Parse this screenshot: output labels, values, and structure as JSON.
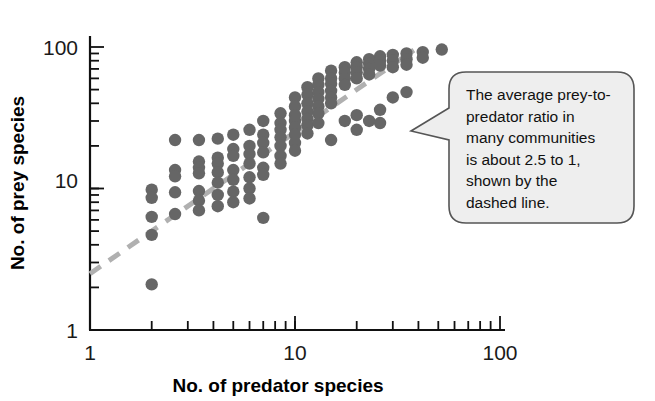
{
  "figure": {
    "background_color": "#ffffff",
    "point_color": "#666666",
    "trendline_color": "#b0b0b0",
    "axis_color": "#111111",
    "callout_fill": "#eeeeee",
    "callout_stroke": "#555555"
  },
  "axes": {
    "x_title": "No. of predator species",
    "y_title": "No. of prey species",
    "x_ticks": [
      "1",
      "10",
      "100"
    ],
    "y_ticks": [
      "1",
      "10",
      "100"
    ]
  },
  "callout": {
    "lines": [
      "The average prey-to-",
      "predator ratio in",
      "many communities",
      "is about 2.5 to 1,",
      "shown by the",
      "dashed line."
    ],
    "full_text": "The average prey-to-predator ratio in many communities is about 2.5 to 1, shown by the dashed line."
  },
  "chart_data": {
    "type": "scatter",
    "title": "",
    "xlabel": "No. of predator species",
    "ylabel": "No. of prey species",
    "xscale": "log",
    "yscale": "log",
    "xlim": [
      1,
      100
    ],
    "ylim": [
      1,
      100
    ],
    "xticks": [
      1,
      10,
      100
    ],
    "yticks": [
      1,
      10,
      100
    ],
    "grid": false,
    "legend": null,
    "annotations": [
      {
        "text": "The average prey-to-predator ratio in many communities is about 2.5 to 1, shown by the dashed line.",
        "type": "callout-balloon",
        "points_to": "dashed trend line"
      }
    ],
    "series": [
      {
        "name": "Food web communities",
        "marker": "circle",
        "color": "#666666",
        "points": [
          [
            2.0,
            9.8
          ],
          [
            2.0,
            8.6
          ],
          [
            2.0,
            6.3
          ],
          [
            2.0,
            4.7
          ],
          [
            2.0,
            2.1
          ],
          [
            2.6,
            22.0
          ],
          [
            2.6,
            13.5
          ],
          [
            2.6,
            12.2
          ],
          [
            2.6,
            9.4
          ],
          [
            2.6,
            6.6
          ],
          [
            3.4,
            22.0
          ],
          [
            3.4,
            15.5
          ],
          [
            3.4,
            14.0
          ],
          [
            3.4,
            12.8
          ],
          [
            3.4,
            9.6
          ],
          [
            3.4,
            8.2
          ],
          [
            3.4,
            7.0
          ],
          [
            4.2,
            22.5
          ],
          [
            4.2,
            16.5
          ],
          [
            4.2,
            15.0
          ],
          [
            4.2,
            13.0
          ],
          [
            4.2,
            11.0
          ],
          [
            4.2,
            9.0
          ],
          [
            4.2,
            7.5
          ],
          [
            5.0,
            24.0
          ],
          [
            5.0,
            19.0
          ],
          [
            5.0,
            17.0
          ],
          [
            5.0,
            13.5
          ],
          [
            5.0,
            11.5
          ],
          [
            5.0,
            9.5
          ],
          [
            5.0,
            8.0
          ],
          [
            6.0,
            26.0
          ],
          [
            6.0,
            20.0
          ],
          [
            6.0,
            17.5
          ],
          [
            6.0,
            15.0
          ],
          [
            6.0,
            12.0
          ],
          [
            6.0,
            10.0
          ],
          [
            6.0,
            8.5
          ],
          [
            7.0,
            30.0
          ],
          [
            7.0,
            24.0
          ],
          [
            7.0,
            21.0
          ],
          [
            7.0,
            18.0
          ],
          [
            7.0,
            14.0
          ],
          [
            7.0,
            12.5
          ],
          [
            7.0,
            6.2
          ],
          [
            8.5,
            34.0
          ],
          [
            8.5,
            29.0
          ],
          [
            8.5,
            26.0
          ],
          [
            8.5,
            23.0
          ],
          [
            8.5,
            20.0
          ],
          [
            8.5,
            17.0
          ],
          [
            8.5,
            15.0
          ],
          [
            10.0,
            44.0
          ],
          [
            10.0,
            38.0
          ],
          [
            10.0,
            33.0
          ],
          [
            10.0,
            30.0
          ],
          [
            10.0,
            27.0
          ],
          [
            10.0,
            24.0
          ],
          [
            10.0,
            21.0
          ],
          [
            10.0,
            18.5
          ],
          [
            11.5,
            52.0
          ],
          [
            11.5,
            46.0
          ],
          [
            11.5,
            40.0
          ],
          [
            11.5,
            35.0
          ],
          [
            11.5,
            31.0
          ],
          [
            11.5,
            28.0
          ],
          [
            11.5,
            24.5
          ],
          [
            13.0,
            60.0
          ],
          [
            13.0,
            54.0
          ],
          [
            13.0,
            48.0
          ],
          [
            13.0,
            43.0
          ],
          [
            13.0,
            38.0
          ],
          [
            13.0,
            34.0
          ],
          [
            13.0,
            29.0
          ],
          [
            15.0,
            68.0
          ],
          [
            15.0,
            60.0
          ],
          [
            15.0,
            55.0
          ],
          [
            15.0,
            49.0
          ],
          [
            15.0,
            44.0
          ],
          [
            15.0,
            40.0
          ],
          [
            15.0,
            22.0
          ],
          [
            17.5,
            72.0
          ],
          [
            17.5,
            66.0
          ],
          [
            17.5,
            60.0
          ],
          [
            17.5,
            54.0
          ],
          [
            17.5,
            30.0
          ],
          [
            20.0,
            78.0
          ],
          [
            20.0,
            72.0
          ],
          [
            20.0,
            66.0
          ],
          [
            20.0,
            60.0
          ],
          [
            20.0,
            33.0
          ],
          [
            20.0,
            26.0
          ],
          [
            23.0,
            82.0
          ],
          [
            23.0,
            76.0
          ],
          [
            23.0,
            70.0
          ],
          [
            23.0,
            64.0
          ],
          [
            23.0,
            30.0
          ],
          [
            26.0,
            86.0
          ],
          [
            26.0,
            80.0
          ],
          [
            26.0,
            74.0
          ],
          [
            26.0,
            36.0
          ],
          [
            26.0,
            29.0
          ],
          [
            30.0,
            88.0
          ],
          [
            30.0,
            80.0
          ],
          [
            30.0,
            72.0
          ],
          [
            30.0,
            44.0
          ],
          [
            35.0,
            90.0
          ],
          [
            35.0,
            82.0
          ],
          [
            35.0,
            75.0
          ],
          [
            35.0,
            48.0
          ],
          [
            42.0,
            92.0
          ],
          [
            42.0,
            84.0
          ],
          [
            52.0,
            96.0
          ]
        ]
      }
    ],
    "trendline": {
      "label": "prey-to-predator ratio 2.5 to 1",
      "style": "dashed",
      "color": "#b0b0b0",
      "ratio": 2.5,
      "from": [
        1.0,
        2.5
      ],
      "to": [
        38.0,
        95.0
      ]
    }
  }
}
